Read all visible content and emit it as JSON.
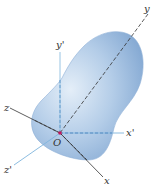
{
  "diagram": {
    "type": "3d-body-with-coordinate-frames",
    "origin_label": "O",
    "body": {
      "shape": "peanut-shaped rigid body",
      "color": "#a9c4e4"
    },
    "frames": [
      {
        "name": "body frame",
        "color": "#333333",
        "axes": {
          "x": "x",
          "y": "y",
          "z": "z"
        }
      },
      {
        "name": "parallel frame",
        "color": "#7fb4dc",
        "axes": {
          "x": "x'",
          "y": "y'",
          "z": "z'"
        }
      }
    ]
  },
  "colors": {
    "origin_dot": "#c2185b",
    "primed_axes": "#7fb4dc",
    "body_axes": "#333333"
  }
}
